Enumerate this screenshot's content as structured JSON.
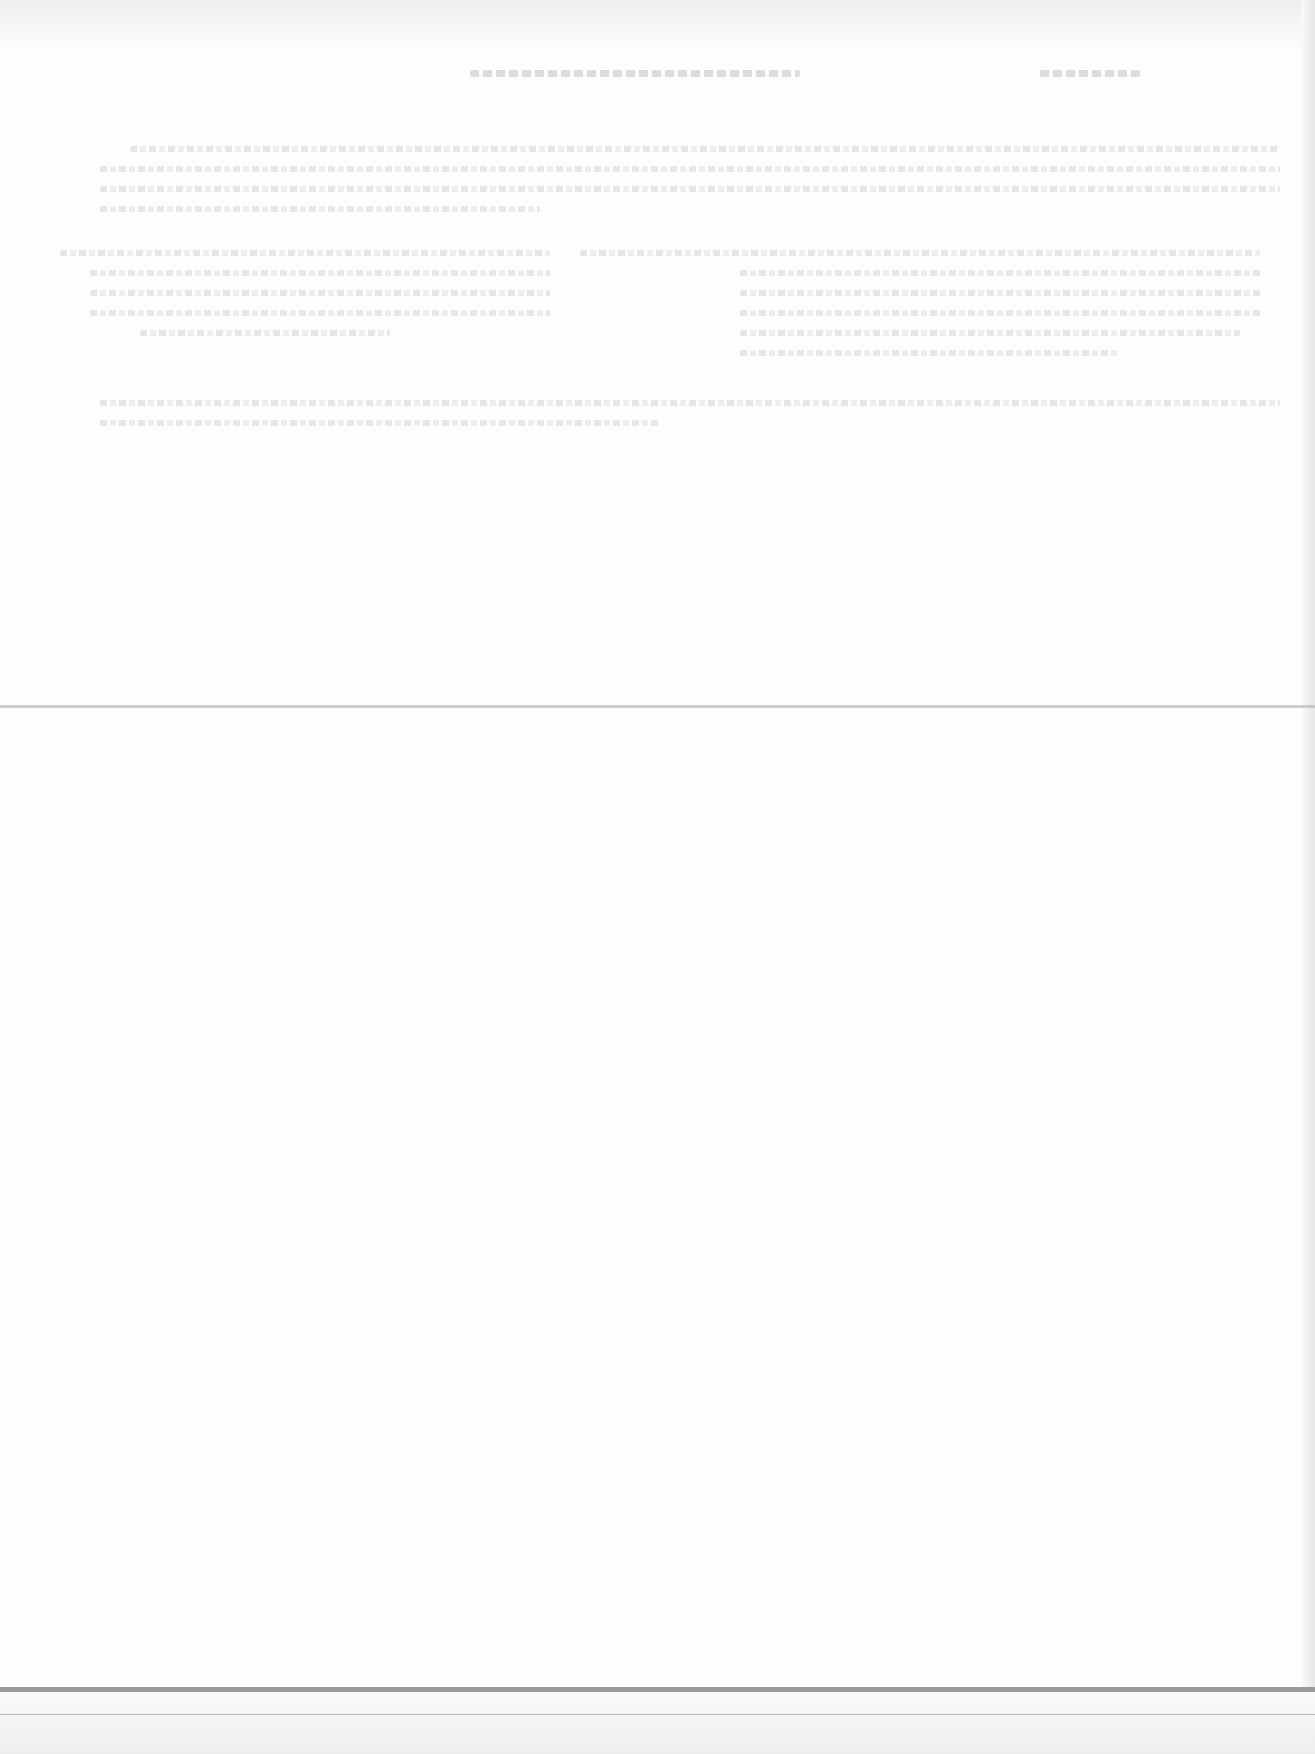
{
  "document": {
    "type": "scanned-page",
    "legibility": "text too faded to read",
    "header": {
      "title": "",
      "page_number": ""
    },
    "upper_section": {
      "paragraph_blocks": 4
    },
    "lower_section": {
      "content": ""
    },
    "rules": [
      "middle-divider",
      "bottom-thick-rule",
      "bottom-thin-rule"
    ]
  }
}
